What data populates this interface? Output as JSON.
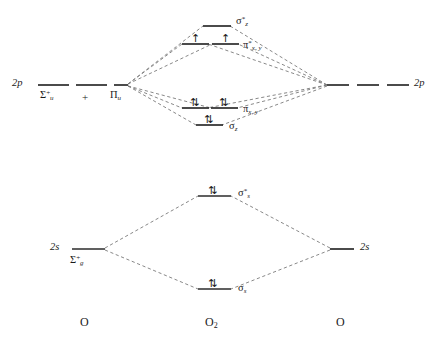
{
  "diagram": {
    "type": "mo-energy-diagram",
    "line_color": "#2b2b2b",
    "dash_color": "#777777",
    "background": "#ffffff"
  },
  "atoms": {
    "left": "O",
    "center": "O",
    "center_sub": "2",
    "right": "O"
  },
  "left_atom": {
    "p_label": "2p",
    "p_term_sigma": "Σ",
    "p_term_sigma_sup": "+",
    "p_term_sigma_sub": "u",
    "plus": "+",
    "p_term_pi": "Π",
    "p_term_pi_sub": "u",
    "s_label": "2s",
    "s_term_sigma": "Σ",
    "s_term_sigma_sup": "+",
    "s_term_sigma_sub": "g"
  },
  "right_atom": {
    "p_label": "2p",
    "s_label": "2s"
  },
  "molecular_orbitals": [
    {
      "id": "sigma-z-star",
      "name": "σ",
      "superscript": "*",
      "subscript": "z",
      "electrons": "",
      "electron_count": 0,
      "level": "antibonding",
      "shell": "2p"
    },
    {
      "id": "pi-star-x",
      "name": "π",
      "superscript": "*",
      "subscript": "x, y",
      "electrons": "↑",
      "electron_count": 1,
      "level": "antibonding",
      "shell": "2p"
    },
    {
      "id": "pi-star-y",
      "name": "",
      "superscript": "",
      "subscript": "",
      "electrons": "↑",
      "electron_count": 1,
      "level": "antibonding",
      "shell": "2p"
    },
    {
      "id": "pi-x",
      "name": "π",
      "superscript": "",
      "subscript": "x, y",
      "electrons": "⇅",
      "electron_count": 2,
      "level": "bonding",
      "shell": "2p"
    },
    {
      "id": "pi-y",
      "name": "",
      "superscript": "",
      "subscript": "",
      "electrons": "⇅",
      "electron_count": 2,
      "level": "bonding",
      "shell": "2p"
    },
    {
      "id": "sigma-z",
      "name": "σ",
      "superscript": "",
      "subscript": "z",
      "electrons": "⇅",
      "electron_count": 2,
      "level": "bonding",
      "shell": "2p"
    },
    {
      "id": "sigma-s-star",
      "name": "σ",
      "superscript": "*",
      "subscript": "s",
      "electrons": "⇅",
      "electron_count": 2,
      "level": "antibonding",
      "shell": "2s"
    },
    {
      "id": "sigma-s",
      "name": "σ",
      "superscript": "",
      "subscript": "s",
      "electrons": "⇅",
      "electron_count": 2,
      "level": "bonding",
      "shell": "2s"
    }
  ],
  "labels": {
    "sigma_z_star_main": "σ",
    "sigma_z_star_sup": "*",
    "sigma_z_star_sub": "z",
    "pi_star_main": "π",
    "pi_star_sup": "*",
    "pi_star_sub": "x, y",
    "pi_main": "π",
    "pi_sub": "x, y",
    "sigma_z_main": "σ",
    "sigma_z_sub": "z",
    "sigma_s_star_main": "σ",
    "sigma_s_star_sup": "*",
    "sigma_s_star_sub": "s",
    "sigma_s_main": "σ",
    "sigma_s_sub": "s"
  },
  "electron_marks": {
    "single_up": "↑",
    "paired": "⇅"
  }
}
